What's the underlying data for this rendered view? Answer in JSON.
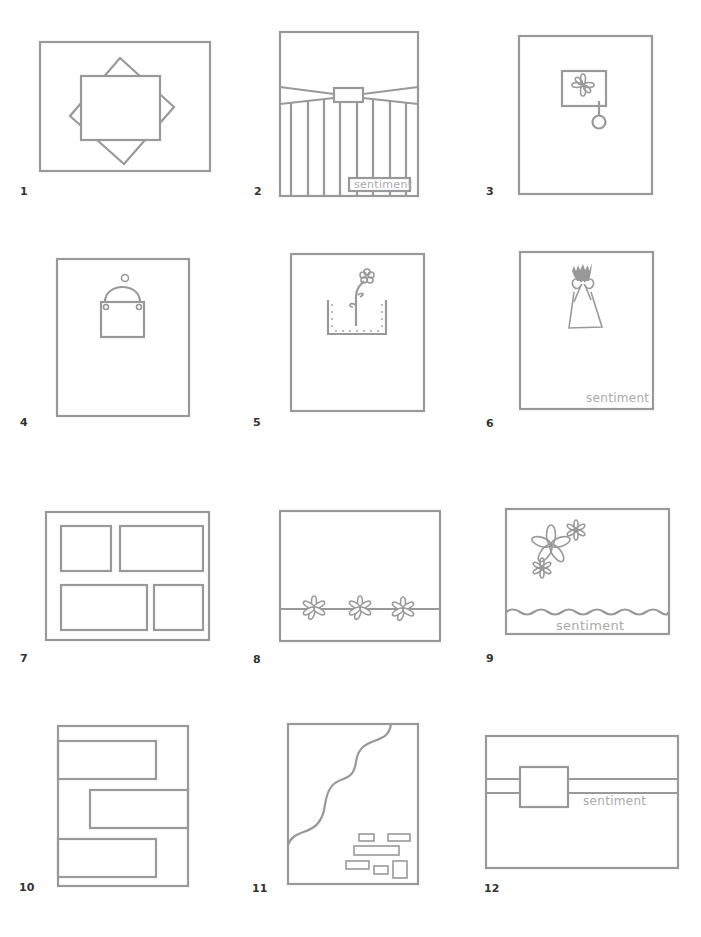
{
  "line_color": "#999999",
  "label_color": "#333333",
  "sentiment_color": "#aaaaaa",
  "sketches": [
    {
      "number": "1",
      "description": "Landscape card with square matted panel over a rotated square"
    },
    {
      "number": "2",
      "description": "Portrait card with pleated ribbon band, buckle, vertical stripes and sentiment label",
      "sentiment": "sentiment"
    },
    {
      "number": "3",
      "description": "Portrait card with small flower panel and hanging tag"
    },
    {
      "number": "4",
      "description": "Portrait card with a hanging sign panel"
    },
    {
      "number": "5",
      "description": "Portrait card with stitched pocket holding a flower stem"
    },
    {
      "number": "6",
      "description": "Portrait card with bouquet tied with bow",
      "sentiment": "sentiment"
    },
    {
      "number": "7",
      "description": "Landscape card with four photo panels in a grid"
    },
    {
      "number": "8",
      "description": "Landscape card with three flowers on a horizontal border"
    },
    {
      "number": "9",
      "description": "Landscape card with flower cluster and scalloped border",
      "sentiment": "sentiment"
    },
    {
      "number": "10",
      "description": "Portrait card with three staggered horizontal blocks"
    },
    {
      "number": "11",
      "description": "Portrait card with wavy diagonal edge and scattered small rectangles"
    },
    {
      "number": "12",
      "description": "Landscape card with horizontal band and square panel",
      "sentiment": "sentiment"
    }
  ]
}
